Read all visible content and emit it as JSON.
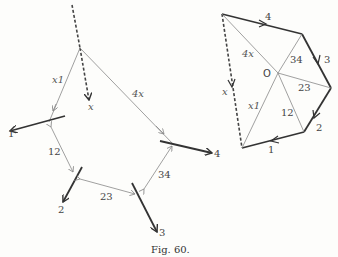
{
  "figure": {
    "caption": "Fig. 60."
  },
  "funicular_diagram": {
    "ray_labels": {
      "x": "x",
      "x1": "x1",
      "r12": "12",
      "r23": "23",
      "r34": "34",
      "r4x": "4x"
    },
    "force_labels": {
      "f1": "1",
      "f2": "2",
      "f3": "3",
      "f4": "4"
    }
  },
  "force_polygon": {
    "pole_label": "O",
    "side_labels": {
      "s1": "1",
      "s2": "2",
      "s3": "3",
      "s4": "4",
      "x": "x"
    },
    "ray_labels": {
      "r4x": "4x",
      "r34": "34",
      "r23": "23",
      "r12": "12",
      "x1": "x1"
    }
  },
  "colors": {
    "thin_line": "#888888",
    "thick_line": "#333333",
    "background": "#fdfdfb"
  }
}
